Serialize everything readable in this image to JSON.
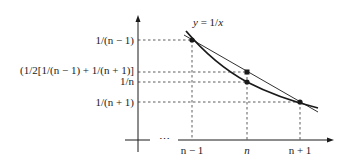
{
  "figure": {
    "type": "function-plot-diagram",
    "curve_label": "y = 1/x",
    "curve_label_parts": {
      "y": "y",
      "eq": " = 1/",
      "x": "x"
    },
    "y_axis_labels": [
      {
        "id": "inv_n_minus_1",
        "text": "1/(n − 1)"
      },
      {
        "id": "half_sum",
        "text": "(1/2[1/(n − 1) + 1/(n + 1)]"
      },
      {
        "id": "inv_n",
        "text": "1/n"
      },
      {
        "id": "inv_n_plus_1",
        "text": "1/(n + 1)"
      }
    ],
    "x_axis_labels": [
      {
        "id": "n_minus_1",
        "text": "n − 1"
      },
      {
        "id": "n",
        "text": "n"
      },
      {
        "id": "n_plus_1",
        "text": "n + 1"
      }
    ],
    "x_axis_ellipsis": "⋯",
    "points": [
      {
        "name": "point-n-minus-1",
        "x_label": "n − 1",
        "y_label": "1/(n − 1)",
        "on": "curve and chord"
      },
      {
        "name": "point-chord-midpoint",
        "x_label": "n",
        "y_label": "(1/2[1/(n − 1) + 1/(n + 1)]",
        "on": "chord"
      },
      {
        "name": "point-n",
        "x_label": "n",
        "y_label": "1/n",
        "on": "curve"
      },
      {
        "name": "point-n-plus-1",
        "x_label": "n + 1",
        "y_label": "1/(n + 1)",
        "on": "curve and chord"
      }
    ],
    "colors": {
      "ink": "#1a1a1a",
      "background": "#ffffff"
    }
  }
}
